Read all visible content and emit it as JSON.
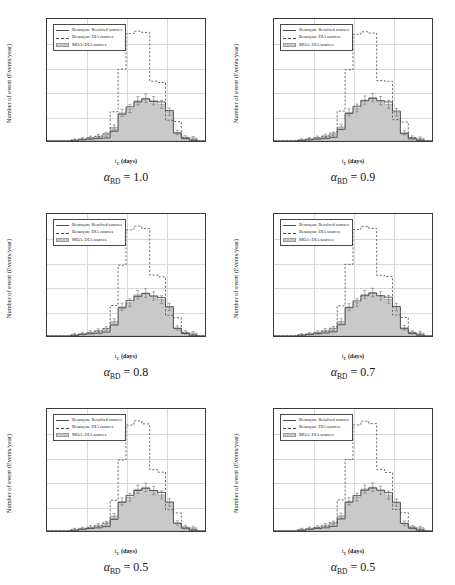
{
  "figure": {
    "panel_count": 6,
    "layout": "2 columns x 3 rows"
  },
  "axes": {
    "ylabel": "Number of event (Events/year)",
    "xlabel_main": "t",
    "xlabel_sub": "E",
    "xlabel_unit": " (days)",
    "yticks": [
      "0",
      "200",
      "400",
      "600",
      "800",
      "1000"
    ],
    "ytick_values": [
      0,
      200,
      400,
      600,
      800,
      1000
    ],
    "xtick_exponents": [
      "-1",
      "0",
      "1",
      "2",
      "3"
    ],
    "ylim": [
      0,
      1000
    ],
    "xlim_log10": [
      -1,
      3
    ]
  },
  "legend": {
    "position": "upper left",
    "entries": [
      {
        "label": "Besançon: Resolved sources",
        "style": "solid"
      },
      {
        "label": "Besançon: DIA sources",
        "style": "dashed"
      },
      {
        "label": "MOA: DIA sources",
        "style": "patch"
      }
    ]
  },
  "colors": {
    "solid_line": "#4a4a4a",
    "dashed_line": "#4a4a4a",
    "fill_patch": "#c9c9c9",
    "patch_edge": "#9a9a9a",
    "grid": "#d8d8d8",
    "frame": "#3a3a3a"
  },
  "captions": [
    {
      "alpha": "α",
      "sub": "BD",
      "eq": " = 1.0"
    },
    {
      "alpha": "α",
      "sub": "BD",
      "eq": " = 0.9"
    },
    {
      "alpha": "α",
      "sub": "BD",
      "eq": " = 0.8"
    },
    {
      "alpha": "α",
      "sub": "BD",
      "eq": " = 0.7"
    },
    {
      "alpha": "α",
      "sub": "BD",
      "eq": " = 0.5"
    },
    {
      "alpha": "α",
      "sub": "BD",
      "eq": " = 0.5"
    }
  ],
  "chart_data": [
    {
      "type": "line",
      "title": "alpha_BD = 1.0",
      "xlabel": "t_E (days)",
      "ylabel": "Number of event (Events/year)",
      "xscale": "log",
      "xlim": [
        0.1,
        1000
      ],
      "ylim": [
        0,
        1000
      ],
      "grid": true,
      "bin_edges_log10": [
        -1.0,
        -0.8,
        -0.6,
        -0.4,
        -0.2,
        0.0,
        0.2,
        0.4,
        0.6,
        0.8,
        1.0,
        1.2,
        1.4,
        1.6,
        1.8,
        2.0,
        2.2,
        2.4,
        2.6,
        2.8,
        3.0
      ],
      "series": [
        {
          "name": "Besançon: Resolved sources",
          "style": "solid",
          "values": [
            0,
            0,
            0,
            5,
            10,
            15,
            20,
            25,
            80,
            220,
            280,
            320,
            345,
            325,
            320,
            250,
            65,
            20,
            5,
            0
          ]
        },
        {
          "name": "Besançon: DIA sources",
          "style": "dashed",
          "values": [
            0,
            0,
            0,
            5,
            15,
            25,
            35,
            60,
            240,
            590,
            880,
            900,
            890,
            490,
            480,
            170,
            160,
            30,
            10,
            0
          ]
        },
        {
          "name": "MOA: DIA sources",
          "style": "filled",
          "values": [
            0,
            0,
            0,
            10,
            18,
            28,
            40,
            55,
            110,
            230,
            265,
            330,
            350,
            330,
            300,
            240,
            70,
            30,
            25,
            0
          ],
          "errors": [
            0,
            0,
            0,
            8,
            10,
            12,
            14,
            16,
            22,
            30,
            32,
            34,
            35,
            34,
            32,
            30,
            18,
            14,
            12,
            0
          ]
        }
      ]
    },
    {
      "type": "line",
      "title": "alpha_BD = 0.9",
      "xlabel": "t_E (days)",
      "ylabel": "Number of event (Events/year)",
      "xscale": "log",
      "xlim": [
        0.1,
        1000
      ],
      "ylim": [
        0,
        1000
      ],
      "grid": true,
      "bin_edges_log10": [
        -1.0,
        -0.8,
        -0.6,
        -0.4,
        -0.2,
        0.0,
        0.2,
        0.4,
        0.6,
        0.8,
        1.0,
        1.2,
        1.4,
        1.6,
        1.8,
        2.0,
        2.2,
        2.4,
        2.6,
        2.8,
        3.0
      ],
      "series": [
        {
          "name": "Besançon: Resolved sources",
          "style": "solid",
          "values": [
            0,
            0,
            0,
            5,
            10,
            15,
            20,
            30,
            95,
            225,
            285,
            330,
            350,
            330,
            320,
            245,
            60,
            18,
            5,
            0
          ]
        },
        {
          "name": "Besançon: DIA sources",
          "style": "dashed",
          "values": [
            0,
            0,
            0,
            5,
            15,
            25,
            35,
            65,
            245,
            585,
            875,
            895,
            885,
            495,
            490,
            175,
            155,
            28,
            10,
            0
          ]
        },
        {
          "name": "MOA: DIA sources",
          "style": "filled",
          "values": [
            0,
            0,
            0,
            10,
            18,
            28,
            42,
            58,
            115,
            235,
            270,
            335,
            355,
            330,
            300,
            235,
            68,
            28,
            22,
            0
          ],
          "errors": [
            0,
            0,
            0,
            8,
            10,
            12,
            14,
            16,
            22,
            30,
            32,
            34,
            35,
            34,
            32,
            30,
            18,
            14,
            12,
            0
          ]
        }
      ]
    },
    {
      "type": "line",
      "title": "alpha_BD = 0.8",
      "xlabel": "t_E (days)",
      "ylabel": "Number of event (Events/year)",
      "xscale": "log",
      "xlim": [
        0.1,
        1000
      ],
      "ylim": [
        0,
        1000
      ],
      "grid": true,
      "bin_edges_log10": [
        -1.0,
        -0.8,
        -0.6,
        -0.4,
        -0.2,
        0.0,
        0.2,
        0.4,
        0.6,
        0.8,
        1.0,
        1.2,
        1.4,
        1.6,
        1.8,
        2.0,
        2.2,
        2.4,
        2.6,
        2.8,
        3.0
      ],
      "series": [
        {
          "name": "Besançon: Resolved sources",
          "style": "solid",
          "values": [
            0,
            0,
            0,
            5,
            12,
            18,
            22,
            32,
            90,
            230,
            290,
            325,
            348,
            328,
            315,
            240,
            62,
            20,
            5,
            0
          ]
        },
        {
          "name": "Besançon: DIA sources",
          "style": "dashed",
          "values": [
            0,
            0,
            0,
            5,
            15,
            25,
            38,
            62,
            250,
            580,
            870,
            900,
            880,
            500,
            485,
            170,
            150,
            30,
            10,
            0
          ]
        },
        {
          "name": "MOA: DIA sources",
          "style": "filled",
          "values": [
            0,
            0,
            0,
            12,
            20,
            30,
            45,
            60,
            118,
            240,
            272,
            338,
            352,
            328,
            298,
            238,
            66,
            30,
            24,
            0
          ],
          "errors": [
            0,
            0,
            0,
            8,
            10,
            12,
            14,
            16,
            22,
            30,
            32,
            34,
            35,
            34,
            32,
            30,
            18,
            14,
            12,
            0
          ]
        }
      ]
    },
    {
      "type": "line",
      "title": "alpha_BD = 0.7",
      "xlabel": "t_E (days)",
      "ylabel": "Number of event (Events/year)",
      "xscale": "log",
      "xlim": [
        0.1,
        1000
      ],
      "ylim": [
        0,
        1000
      ],
      "grid": true,
      "bin_edges_log10": [
        -1.0,
        -0.8,
        -0.6,
        -0.4,
        -0.2,
        0.0,
        0.2,
        0.4,
        0.6,
        0.8,
        1.0,
        1.2,
        1.4,
        1.6,
        1.8,
        2.0,
        2.2,
        2.4,
        2.6,
        2.8,
        3.0
      ],
      "series": [
        {
          "name": "Besançon: Resolved sources",
          "style": "solid",
          "values": [
            0,
            0,
            0,
            6,
            12,
            18,
            24,
            34,
            92,
            232,
            288,
            330,
            352,
            330,
            318,
            242,
            60,
            20,
            6,
            0
          ]
        },
        {
          "name": "Besançon: DIA sources",
          "style": "dashed",
          "values": [
            0,
            0,
            0,
            6,
            16,
            26,
            38,
            64,
            248,
            588,
            872,
            898,
            882,
            498,
            488,
            172,
            152,
            30,
            10,
            0
          ]
        },
        {
          "name": "MOA: DIA sources",
          "style": "filled",
          "values": [
            0,
            0,
            0,
            12,
            20,
            30,
            46,
            62,
            120,
            238,
            274,
            340,
            356,
            330,
            300,
            236,
            68,
            30,
            24,
            0
          ],
          "errors": [
            0,
            0,
            0,
            8,
            10,
            12,
            14,
            16,
            22,
            30,
            32,
            34,
            35,
            34,
            32,
            30,
            18,
            14,
            12,
            0
          ]
        }
      ]
    },
    {
      "type": "line",
      "title": "alpha_BD = 0.5 (left)",
      "xlabel": "t_E (days)",
      "ylabel": "Number of event (Events/year)",
      "xscale": "log",
      "xlim": [
        0.1,
        1000
      ],
      "ylim": [
        0,
        1000
      ],
      "grid": true,
      "bin_edges_log10": [
        -1.0,
        -0.8,
        -0.6,
        -0.4,
        -0.2,
        0.0,
        0.2,
        0.4,
        0.6,
        0.8,
        1.0,
        1.2,
        1.4,
        1.6,
        1.8,
        2.0,
        2.2,
        2.4,
        2.6,
        2.8,
        3.0
      ],
      "series": [
        {
          "name": "Besançon: Resolved sources",
          "style": "solid",
          "values": [
            0,
            0,
            0,
            6,
            14,
            20,
            26,
            36,
            95,
            235,
            292,
            332,
            350,
            332,
            316,
            238,
            64,
            22,
            6,
            0
          ]
        },
        {
          "name": "Besançon: DIA sources",
          "style": "dashed",
          "values": [
            0,
            0,
            0,
            6,
            16,
            26,
            40,
            66,
            252,
            582,
            868,
            902,
            878,
            502,
            482,
            174,
            148,
            32,
            10,
            0
          ]
        },
        {
          "name": "MOA: DIA sources",
          "style": "filled",
          "values": [
            0,
            0,
            0,
            14,
            22,
            32,
            48,
            64,
            122,
            242,
            276,
            342,
            358,
            332,
            296,
            234,
            66,
            32,
            26,
            0
          ],
          "errors": [
            0,
            0,
            0,
            8,
            10,
            12,
            14,
            16,
            22,
            30,
            32,
            34,
            35,
            34,
            32,
            30,
            18,
            14,
            12,
            0
          ]
        }
      ]
    },
    {
      "type": "line",
      "title": "alpha_BD = 0.5 (right)",
      "xlabel": "t_E (days)",
      "ylabel": "Number of event (Events/year)",
      "xscale": "log",
      "xlim": [
        0.1,
        1000
      ],
      "ylim": [
        0,
        1000
      ],
      "grid": true,
      "bin_edges_log10": [
        -1.0,
        -0.8,
        -0.6,
        -0.4,
        -0.2,
        0.0,
        0.2,
        0.4,
        0.6,
        0.8,
        1.0,
        1.2,
        1.4,
        1.6,
        1.8,
        2.0,
        2.2,
        2.4,
        2.6,
        2.8,
        3.0
      ],
      "series": [
        {
          "name": "Besançon: Resolved sources",
          "style": "solid",
          "values": [
            0,
            0,
            0,
            6,
            14,
            20,
            26,
            38,
            98,
            236,
            290,
            334,
            352,
            334,
            314,
            236,
            62,
            22,
            6,
            0
          ]
        },
        {
          "name": "Besançon: DIA sources",
          "style": "dashed",
          "values": [
            0,
            0,
            0,
            6,
            16,
            28,
            40,
            68,
            255,
            585,
            870,
            900,
            880,
            505,
            480,
            176,
            150,
            32,
            10,
            0
          ]
        },
        {
          "name": "MOA: DIA sources",
          "style": "filled",
          "values": [
            0,
            0,
            0,
            14,
            22,
            32,
            48,
            66,
            125,
            244,
            278,
            344,
            360,
            334,
            294,
            232,
            64,
            32,
            26,
            0
          ],
          "errors": [
            0,
            0,
            0,
            8,
            10,
            12,
            14,
            16,
            22,
            30,
            32,
            34,
            35,
            34,
            32,
            30,
            18,
            14,
            12,
            0
          ]
        }
      ]
    }
  ]
}
